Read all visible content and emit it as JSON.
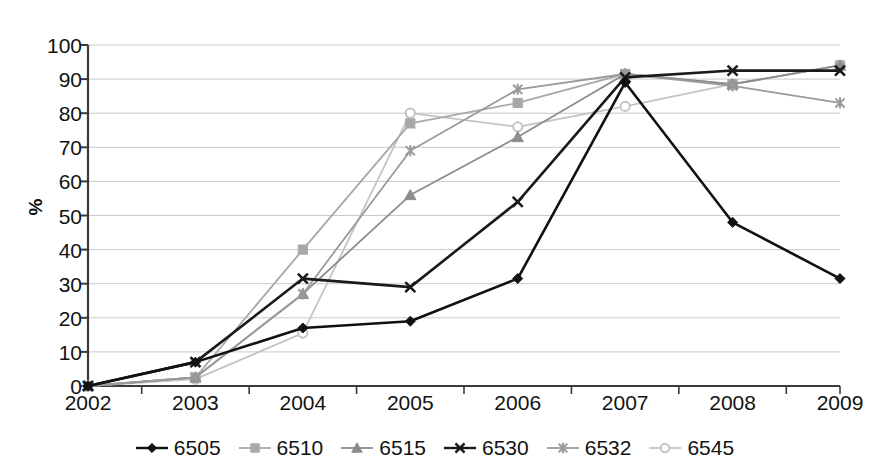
{
  "chart_data": {
    "type": "line",
    "title": "",
    "subtitle": "",
    "xlabel": "",
    "ylabel": "%",
    "categories": [
      "2002",
      "2003",
      "2004",
      "2005",
      "2006",
      "2007",
      "2008",
      "2009"
    ],
    "x": [
      2002,
      2003,
      2004,
      2005,
      2006,
      2007,
      2008,
      2009
    ],
    "xlim": [
      2002,
      2009
    ],
    "ylim": [
      0,
      100
    ],
    "yticks": [
      0,
      10,
      20,
      30,
      40,
      50,
      60,
      70,
      80,
      90,
      100
    ],
    "grid": "horizontal",
    "legend_position": "bottom",
    "series": [
      {
        "name": "6505",
        "marker": "diamond",
        "color": "#111111",
        "values": [
          0,
          7,
          17,
          19,
          31.5,
          89,
          48,
          31.5
        ]
      },
      {
        "name": "6510",
        "marker": "square",
        "color": "#a8a8a8",
        "values": [
          0,
          2.5,
          40,
          77,
          83,
          91.5,
          88.5,
          94
        ]
      },
      {
        "name": "6515",
        "marker": "triangle",
        "color": "#8c8c8c",
        "values": [
          0,
          2.5,
          27,
          56,
          73,
          91.5,
          88.5,
          94
        ]
      },
      {
        "name": "6530",
        "marker": "cross",
        "color": "#1a1a1a",
        "values": [
          0,
          7,
          31.5,
          29,
          54,
          90.5,
          92.5,
          92.5
        ]
      },
      {
        "name": "6532",
        "marker": "asterisk",
        "color": "#9a9a9a",
        "values": [
          0,
          2.5,
          27,
          69,
          87,
          91.5,
          88,
          83
        ]
      },
      {
        "name": "6545",
        "marker": "circle",
        "color": "#c4c4c4",
        "values": [
          0,
          2,
          15.5,
          80,
          76,
          82,
          88.5,
          94
        ]
      }
    ]
  },
  "axis": {
    "y_tick_labels": [
      "100",
      "90",
      "80",
      "70",
      "60",
      "50",
      "40",
      "30",
      "20",
      "10",
      "0"
    ],
    "y_title": "%",
    "x_tick_labels": [
      "2002",
      "2003",
      "2004",
      "2005",
      "2006",
      "2007",
      "2008",
      "2009"
    ]
  },
  "legend": {
    "items": [
      {
        "label": "6505",
        "marker": "diamond-marker-icon",
        "color": "#111111"
      },
      {
        "label": "6510",
        "marker": "square-marker-icon",
        "color": "#a8a8a8"
      },
      {
        "label": "6515",
        "marker": "triangle-marker-icon",
        "color": "#8c8c8c"
      },
      {
        "label": "6530",
        "marker": "cross-marker-icon",
        "color": "#1a1a1a"
      },
      {
        "label": "6532",
        "marker": "asterisk-marker-icon",
        "color": "#9a9a9a"
      },
      {
        "label": "6545",
        "marker": "circle-marker-icon",
        "color": "#c4c4c4"
      }
    ]
  },
  "style": {
    "plot_background": "#ffffff",
    "gridline_color": "#c9c9c9",
    "axis_color": "#3a3a3a"
  }
}
